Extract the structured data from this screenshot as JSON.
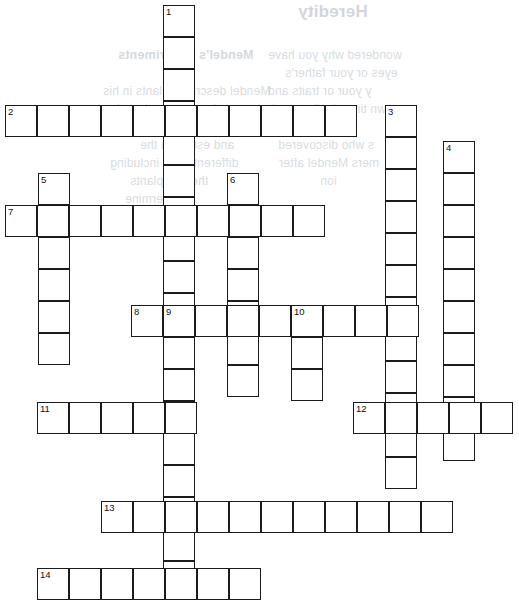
{
  "page": {
    "width": 519,
    "height": 612,
    "background": "#ffffff",
    "ink": "#1b1b1b",
    "bleed_color": "#b9c0c7"
  },
  "puzzle": {
    "kind": "crossword",
    "cell_size": 32,
    "border_width": 1.6,
    "numbers_visible": [
      1,
      2,
      3,
      4,
      5,
      6,
      7,
      8,
      9,
      10,
      11,
      12,
      13,
      14
    ],
    "entries": [
      {
        "number": 1,
        "direction": "down",
        "x": 163,
        "y": 5,
        "length": 17
      },
      {
        "number": 2,
        "direction": "across",
        "x": 5,
        "y": 105,
        "length": 11
      },
      {
        "number": 3,
        "direction": "down",
        "x": 385,
        "y": 105,
        "length": 12
      },
      {
        "number": 4,
        "direction": "down",
        "x": 443,
        "y": 141,
        "length": 10
      },
      {
        "number": 5,
        "direction": "down",
        "x": 38,
        "y": 173,
        "length": 6
      },
      {
        "number": 6,
        "direction": "down",
        "x": 227,
        "y": 173,
        "length": 7
      },
      {
        "number": 7,
        "direction": "across",
        "x": 5,
        "y": 205,
        "length": 10
      },
      {
        "number": 8,
        "direction": "across",
        "x": 131,
        "y": 305,
        "length": 9
      },
      {
        "number": 9,
        "direction": "down",
        "x": 163,
        "y": 305,
        "length": 9
      },
      {
        "number": 10,
        "direction": "down",
        "x": 291,
        "y": 305,
        "length": 3
      },
      {
        "number": 11,
        "direction": "across",
        "x": 37,
        "y": 402,
        "length": 5
      },
      {
        "number": 12,
        "direction": "across",
        "x": 353,
        "y": 402,
        "length": 5
      },
      {
        "number": 13,
        "direction": "across",
        "x": 101,
        "y": 501,
        "length": 11
      },
      {
        "number": 14,
        "direction": "across",
        "x": 37,
        "y": 568,
        "length": 7
      }
    ]
  },
  "bleed_through": {
    "note": "Mirrored show-through text from the reverse side of the worksheet",
    "items": [
      {
        "text": "Heredity",
        "x": 298,
        "y": 2,
        "style": "title"
      },
      {
        "text": "wondered why you have",
        "x": 268,
        "y": 48,
        "style": "body"
      },
      {
        "text": "Mendel's Experiments",
        "x": 118,
        "y": 48,
        "style": "head"
      },
      {
        "text": "eyes or your father's",
        "x": 285,
        "y": 66,
        "style": "body"
      },
      {
        "text": "y your or traits and",
        "x": 268,
        "y": 84,
        "style": "body"
      },
      {
        "text": "Mendel described plants in his",
        "x": 103,
        "y": 84,
        "style": "body"
      },
      {
        "text": "own time, it all started",
        "x": 272,
        "y": 102,
        "style": "body"
      },
      {
        "text": "experiments that there is a",
        "x": 100,
        "y": 102,
        "style": "body"
      },
      {
        "text": "two German",
        "x": 290,
        "y": 120,
        "style": "body"
      },
      {
        "text": "recessive traits and can be",
        "x": 103,
        "y": 120,
        "style": "body"
      },
      {
        "text": "s who discovered",
        "x": 278,
        "y": 138,
        "style": "body"
      },
      {
        "text": "and establish the",
        "x": 140,
        "y": 138,
        "style": "body"
      },
      {
        "text": "mers Mendel after",
        "x": 279,
        "y": 156,
        "style": "body"
      },
      {
        "text": "different traits including",
        "x": 110,
        "y": 156,
        "style": "body"
      },
      {
        "text": "ion",
        "x": 320,
        "y": 174,
        "style": "body"
      },
      {
        "text": "the pea plants",
        "x": 130,
        "y": 174,
        "style": "body"
      },
      {
        "text": "to determine",
        "x": 125,
        "y": 192,
        "style": "body"
      },
      {
        "text": "the traits",
        "x": 140,
        "y": 210,
        "style": "body"
      }
    ]
  }
}
